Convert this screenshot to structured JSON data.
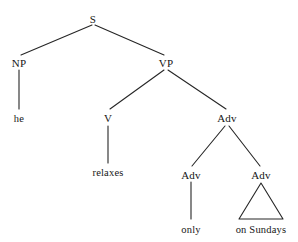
{
  "figure": {
    "kind": "syntax-tree",
    "sentence": "he relaxes only on Sundays",
    "background_color": "#ffffff",
    "line_color": "#262626",
    "text_color": "#161616"
  },
  "nodes": {
    "s": {
      "label": "S",
      "x": 93,
      "y": 14
    },
    "np": {
      "label": "NP",
      "x": 19,
      "y": 58
    },
    "vp": {
      "label": "VP",
      "x": 166,
      "y": 58
    },
    "he": {
      "label": "he",
      "x": 19,
      "y": 113
    },
    "v": {
      "label": "V",
      "x": 108,
      "y": 113
    },
    "adv_top": {
      "label": "Adv",
      "x": 227,
      "y": 113
    },
    "relaxes": {
      "label": "relaxes",
      "x": 108,
      "y": 167
    },
    "adv_left": {
      "label": "Adv",
      "x": 191,
      "y": 170
    },
    "adv_right": {
      "label": "Adv",
      "x": 261,
      "y": 170
    },
    "only": {
      "label": "only",
      "x": 191,
      "y": 224
    },
    "on_sundays": {
      "label": "on Sundays",
      "x": 261,
      "y": 224
    }
  },
  "edges": [
    {
      "name": "s-to-np",
      "x1": 92,
      "y1": 25,
      "x2": 21,
      "y2": 55
    },
    {
      "name": "s-to-vp",
      "x1": 95,
      "y1": 25,
      "x2": 164,
      "y2": 55
    },
    {
      "name": "np-to-he",
      "x1": 19,
      "y1": 70,
      "x2": 19,
      "y2": 109
    },
    {
      "name": "vp-to-v",
      "x1": 164,
      "y1": 70,
      "x2": 110,
      "y2": 109
    },
    {
      "name": "vp-to-adv",
      "x1": 168,
      "y1": 70,
      "x2": 226,
      "y2": 109
    },
    {
      "name": "v-to-relaxes",
      "x1": 108,
      "y1": 126,
      "x2": 108,
      "y2": 163
    },
    {
      "name": "adv-to-adv-left",
      "x1": 225,
      "y1": 126,
      "x2": 192,
      "y2": 166
    },
    {
      "name": "adv-to-adv-right",
      "x1": 229,
      "y1": 126,
      "x2": 260,
      "y2": 166
    },
    {
      "name": "adv-left-to-only",
      "x1": 191,
      "y1": 182,
      "x2": 191,
      "y2": 219
    }
  ],
  "triangle": {
    "name": "on-sundays-triangle",
    "apex_x": 261,
    "apex_y": 183,
    "left_x": 239,
    "right_x": 283,
    "base_y": 219
  }
}
